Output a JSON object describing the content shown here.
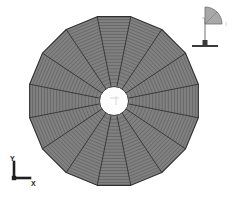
{
  "view": {
    "width": 238,
    "height": 203,
    "background_color": "#ffffff",
    "title": "Axisymmetric disc finite element mesh"
  },
  "mesh": {
    "name": "circular-disc-mesh",
    "shape": "polygonal-disc",
    "center_x": 114,
    "center_y": 101,
    "outer_radius": 86,
    "hub_radius": 14.5,
    "outer_polygon_sides": 16,
    "radial_sectors": 16,
    "circumferential_divisions": 22,
    "sector_start_angle_deg": -11.25,
    "fill_color": "#808080",
    "element_line_color": "#5a5a5a",
    "spoke_line_color": "#3a3a3a",
    "outline_color": "#2e2e2e",
    "hub_fill_color": "#fdfdfd",
    "hub_outline_color": "#3a3a3a",
    "element_line_width": 0.6,
    "spoke_line_width": 1.0,
    "outline_width": 1.1,
    "hub_mark_color": "#c9c9c9",
    "hub_mark_text": ""
  },
  "axis_triad": {
    "name": "axis-triad",
    "origin_x": 14,
    "origin_y": 178,
    "arm_length": 16,
    "line_color": "#1f1f1f",
    "line_width": 2.6,
    "x_label": "X",
    "y_label": "Y"
  },
  "orientation_indicator": {
    "name": "orientation-indicator",
    "pole_x": 205,
    "pole_top_y": 18,
    "pole_bottom_y": 44,
    "wedge_radius": 17,
    "pole_color": "#9a9a9a",
    "wedge_fill_color": "#a8a8a8",
    "wedge_edge_color": "#6f6f6f",
    "base_color": "#3a3a3a",
    "base_width": 26,
    "base_height": 2,
    "base_y": 45,
    "cube_size": 5,
    "top_tick_label": "",
    "side_tick_label": ""
  }
}
